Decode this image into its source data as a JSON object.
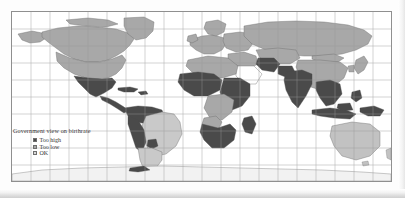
{
  "figure": {
    "kind": "choropleth-world-map",
    "background": "#fdfdfd"
  },
  "legend": {
    "title": "Government view on birthrate",
    "items": [
      {
        "label": "Too high",
        "color": "#4a4a4a"
      },
      {
        "label": "Too low",
        "color": "#a8a8a8"
      },
      {
        "label": "OK",
        "color": "#d8d8d8"
      }
    ]
  },
  "map": {
    "graticule": {
      "visible": true,
      "color": "#9a9a9a",
      "lon_step_px": 19.0,
      "lat_step_px": 17.0
    },
    "frame": {
      "border_color": "#8f8f8f",
      "ocean_color": "#ffffff"
    },
    "categories": {
      "too_high": "#4a4a4a",
      "too_low": "#a8a8a8",
      "ok": "#d8d8d8",
      "no_data": "#ffffff"
    },
    "regions": [
      {
        "name": "Canada",
        "category": "too_low"
      },
      {
        "name": "United States",
        "category": "too_low"
      },
      {
        "name": "Greenland",
        "category": "too_low"
      },
      {
        "name": "Alaska",
        "category": "too_low"
      },
      {
        "name": "Mexico",
        "category": "too_high"
      },
      {
        "name": "Central America",
        "category": "too_high"
      },
      {
        "name": "Caribbean",
        "category": "too_high"
      },
      {
        "name": "Colombia / Venezuela",
        "category": "too_high"
      },
      {
        "name": "Brazil",
        "category": "ok"
      },
      {
        "name": "Peru / Bolivia",
        "category": "too_high"
      },
      {
        "name": "Argentina",
        "category": "ok"
      },
      {
        "name": "Chile",
        "category": "ok"
      },
      {
        "name": "Paraguay / Uruguay",
        "category": "too_high"
      },
      {
        "name": "Western Europe",
        "category": "too_low"
      },
      {
        "name": "Eastern Europe",
        "category": "too_low"
      },
      {
        "name": "Russia",
        "category": "too_low"
      },
      {
        "name": "North Africa",
        "category": "too_low"
      },
      {
        "name": "Sub-Saharan Africa",
        "category": "too_high"
      },
      {
        "name": "Democratic Republic of the Congo",
        "category": "too_low"
      },
      {
        "name": "Angola",
        "category": "too_low"
      },
      {
        "name": "South Africa",
        "category": "too_high"
      },
      {
        "name": "Madagascar",
        "category": "too_high"
      },
      {
        "name": "Saudi Arabia",
        "category": "no_data"
      },
      {
        "name": "Middle East",
        "category": "too_low"
      },
      {
        "name": "Iran",
        "category": "too_high"
      },
      {
        "name": "India",
        "category": "too_high"
      },
      {
        "name": "Pakistan",
        "category": "too_high"
      },
      {
        "name": "China",
        "category": "too_low"
      },
      {
        "name": "Mongolia",
        "category": "too_low"
      },
      {
        "name": "Japan",
        "category": "too_low"
      },
      {
        "name": "Southeast Asia",
        "category": "too_high"
      },
      {
        "name": "Indonesia",
        "category": "too_high"
      },
      {
        "name": "Philippines",
        "category": "too_high"
      },
      {
        "name": "Papua New Guinea",
        "category": "too_high"
      },
      {
        "name": "Australia",
        "category": "ok"
      },
      {
        "name": "New Zealand",
        "category": "ok"
      },
      {
        "name": "Antarctica",
        "category": "no_data"
      }
    ]
  }
}
